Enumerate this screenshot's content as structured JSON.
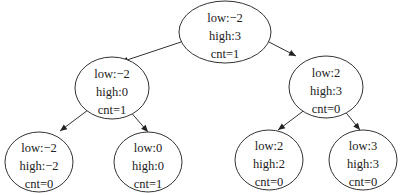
{
  "diagram": {
    "type": "tree",
    "nodes": [
      {
        "id": "root",
        "cx": 225,
        "cy": 32,
        "rx": 46,
        "ry": 31,
        "lines": [
          "low:−2",
          "high:3",
          "cnt=1"
        ]
      },
      {
        "id": "left",
        "cx": 112,
        "cy": 88,
        "rx": 37,
        "ry": 31,
        "lines": [
          "low:−2",
          "high:0",
          "cnt=1"
        ]
      },
      {
        "id": "right",
        "cx": 326,
        "cy": 87,
        "rx": 37,
        "ry": 31,
        "lines": [
          "low:2",
          "high:3",
          "cnt=0"
        ]
      },
      {
        "id": "left-left",
        "cx": 39,
        "cy": 162,
        "rx": 34,
        "ry": 30,
        "lines": [
          "low:−2",
          "high:−2",
          "cnt=0"
        ]
      },
      {
        "id": "left-right",
        "cx": 148,
        "cy": 162,
        "rx": 34,
        "ry": 30,
        "lines": [
          "low:0",
          "high:0",
          "cnt=1"
        ]
      },
      {
        "id": "right-left",
        "cx": 269,
        "cy": 160,
        "rx": 34,
        "ry": 30,
        "lines": [
          "low:2",
          "high:2",
          "cnt=0"
        ]
      },
      {
        "id": "right-right",
        "cx": 363,
        "cy": 160,
        "rx": 34,
        "ry": 30,
        "lines": [
          "low:3",
          "high:3",
          "cnt=0"
        ]
      }
    ],
    "edges": [
      {
        "from": "root",
        "to": "left",
        "x1": 181,
        "y1": 42,
        "x2": 121,
        "y2": 62
      },
      {
        "from": "root",
        "to": "right",
        "x1": 269,
        "y1": 42,
        "x2": 296,
        "y2": 56
      },
      {
        "from": "left",
        "to": "left-left",
        "x1": 88,
        "y1": 110,
        "x2": 60,
        "y2": 131
      },
      {
        "from": "left",
        "to": "left-right",
        "x1": 128,
        "y1": 109,
        "x2": 148,
        "y2": 132
      },
      {
        "from": "right",
        "to": "right-left",
        "x1": 306,
        "y1": 109,
        "x2": 278,
        "y2": 130
      },
      {
        "from": "right",
        "to": "right-right",
        "x1": 343,
        "y1": 109,
        "x2": 360,
        "y2": 130
      }
    ]
  }
}
